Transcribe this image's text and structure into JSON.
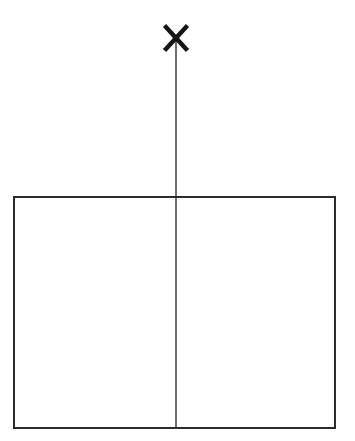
{
  "figure": {
    "type": "geometric-line-drawing",
    "canvas": {
      "width": 355,
      "height": 441,
      "background_color": "#ffffff"
    },
    "colors": {
      "stroke": "#2b2b2b",
      "axis_line": "#6e6e6e",
      "marker": "#141414",
      "background": "#ffffff"
    },
    "shapes": {
      "rectangle": {
        "name": "outer-rectangle",
        "x": 14,
        "y": 197,
        "width": 321,
        "height": 231,
        "stroke_color": "#2b2b2b",
        "stroke_width": 1.6,
        "fill": "none"
      },
      "vertical_line": {
        "name": "vertical-axis-line",
        "x": 176,
        "y_start": 38,
        "y_end": 428,
        "stroke_color": "#6e6e6e",
        "stroke_width": 1.2
      },
      "x_marker": {
        "name": "x-mark",
        "center_x": 176,
        "center_y": 38,
        "half_size": 13,
        "stroke_color": "#141414",
        "stroke_width": 4.4,
        "glyph": "X"
      }
    },
    "measurements": {
      "rectangle_left_edge_x": 14,
      "rectangle_right_edge_x": 335,
      "rectangle_top_edge_y": 197,
      "rectangle_bottom_edge_y": 428,
      "divider_x": 176,
      "left_half_width": 162,
      "right_half_width": 159,
      "line_above_rectangle_length": 159
    }
  }
}
